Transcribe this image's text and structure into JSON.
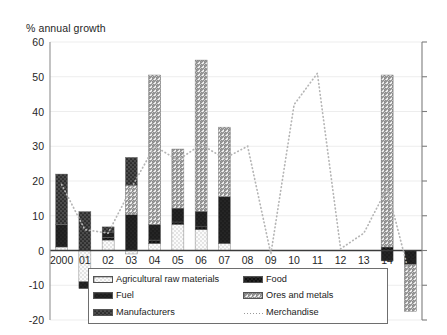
{
  "chart_data": {
    "type": "bar",
    "title": "% annual growth",
    "xlabel": "",
    "ylabel": "% annual growth",
    "ylim": [
      -20,
      60
    ],
    "yticks": [
      60,
      50,
      40,
      30,
      20,
      10,
      0,
      -10,
      -20
    ],
    "grid": true,
    "legend_position": "bottom",
    "stacked": true,
    "categories": [
      "2000",
      "01",
      "02",
      "03",
      "04",
      "05",
      "06",
      "07",
      "08",
      "09",
      "10",
      "11",
      "12",
      "13",
      "14",
      "15"
    ],
    "series": [
      {
        "name": "Agricultural raw materials",
        "pattern": "light-dotted",
        "color": "#efefef",
        "values": [
          1.0,
          -9.0,
          3.0,
          -1.0,
          2.0,
          7.5,
          6.0,
          2.0,
          0,
          0,
          0,
          0,
          0,
          0,
          0,
          0
        ]
      },
      {
        "name": "Food",
        "pattern": "dark-crosshatch",
        "color": "#3a3a3a",
        "values": [
          0,
          0,
          0.8,
          0,
          1.0,
          0.7,
          0.8,
          0,
          0,
          0,
          0,
          0,
          0,
          0,
          1.0,
          0
        ]
      },
      {
        "name": "Fuel",
        "pattern": "solid-dark",
        "color": "#1e1e1e",
        "values": [
          6.5,
          -2.0,
          1.5,
          10.3,
          4.5,
          4.0,
          4.5,
          13.5,
          0,
          0,
          0,
          0,
          0,
          0,
          -3.0,
          -4.0
        ]
      },
      {
        "name": "Ores and metals",
        "pattern": "diagonal-hatch",
        "color": "#c9c9c9",
        "values": [
          0,
          0,
          0,
          8.5,
          43.0,
          17.0,
          43.5,
          20.0,
          0,
          0,
          0,
          0,
          0,
          0,
          49.5,
          -13.5
        ]
      },
      {
        "name": "Manufacturers",
        "pattern": "dark-dotted",
        "color": "#555555",
        "values": [
          14.5,
          11.2,
          1.5,
          8.0,
          0,
          0,
          0,
          0,
          0,
          0,
          0,
          0,
          0,
          0,
          0,
          0
        ]
      }
    ],
    "line_series": {
      "name": "Merchandise",
      "pattern": "dotted-line",
      "color": "#b5b5b5",
      "values": [
        19.0,
        6.0,
        5.0,
        18.0,
        30.0,
        26.0,
        30.5,
        26.5,
        30.0,
        -1.0,
        42.0,
        51.0,
        0.5,
        5.0,
        18.0,
        -8.0
      ]
    }
  },
  "legend": {
    "items": [
      {
        "label": "Agricultural raw materials",
        "swatch": "light-dotted-swatch"
      },
      {
        "label": "Food",
        "swatch": "dark-crosshatch-swatch"
      },
      {
        "label": "Fuel",
        "swatch": "solid-dark-swatch"
      },
      {
        "label": "Ores and metals",
        "swatch": "diagonal-hatch-swatch"
      },
      {
        "label": "Manufacturers",
        "swatch": "dark-dotted-swatch"
      },
      {
        "label": "Merchandise",
        "swatch": "dotted-line-swatch"
      }
    ]
  }
}
